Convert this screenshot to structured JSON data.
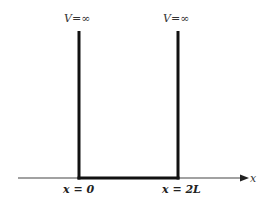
{
  "diagram": {
    "left_wall_label": "V=∞",
    "right_wall_label": "V=∞",
    "axis_label": "x",
    "left_position_label": "x = 0",
    "right_position_label": "x = 2L",
    "colors": {
      "line": "#111111",
      "axis": "#444444",
      "text": "#333333"
    }
  }
}
